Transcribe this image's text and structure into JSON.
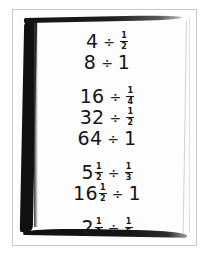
{
  "image": {
    "kind": "photograph",
    "subject": "handwritten-math-worksheet",
    "description": "A photographed sheet of white paper with a heavy black brush-drawn border, showing handwritten division expressions grouped into four blocks",
    "frame_color": "#c9c9c9",
    "border_color": "#111111",
    "paper_color": "#fdfdfd",
    "ink_color": "#151515"
  },
  "worksheet": {
    "groups": [
      {
        "id": "group-1",
        "lines": [
          {
            "id": "line-1",
            "text": "4 ÷ 1/2",
            "left": {
              "whole": "4"
            },
            "operator": "÷",
            "right": {
              "numerator": "1",
              "denominator": "2"
            }
          },
          {
            "id": "line-2",
            "text": "8 ÷ 1",
            "left": {
              "whole": "8"
            },
            "operator": "÷",
            "right": {
              "whole": "1"
            }
          }
        ]
      },
      {
        "id": "group-2",
        "lines": [
          {
            "id": "line-3",
            "text": "16 ÷ 1/4",
            "left": {
              "whole": "16"
            },
            "operator": "÷",
            "right": {
              "numerator": "1",
              "denominator": "4"
            }
          },
          {
            "id": "line-4",
            "text": "32 ÷ 1/2",
            "left": {
              "whole": "32"
            },
            "operator": "÷",
            "right": {
              "numerator": "1",
              "denominator": "2"
            }
          },
          {
            "id": "line-5",
            "text": "64 ÷ 1",
            "left": {
              "whole": "64"
            },
            "operator": "÷",
            "right": {
              "whole": "1"
            }
          }
        ]
      },
      {
        "id": "group-3",
        "lines": [
          {
            "id": "line-6",
            "text": "5 1/2 ÷ 1/3",
            "left": {
              "whole": "5",
              "numerator": "1",
              "denominator": "2"
            },
            "operator": "÷",
            "right": {
              "numerator": "1",
              "denominator": "3"
            }
          },
          {
            "id": "line-7",
            "text": "16 1/2 ÷ 1",
            "left": {
              "whole": "16",
              "numerator": "1",
              "denominator": "2"
            },
            "operator": "÷",
            "right": {
              "whole": "1"
            }
          }
        ]
      },
      {
        "id": "group-4",
        "lines": [
          {
            "id": "line-8",
            "text": "2 1/2 ÷ 1/5",
            "left": {
              "whole": "2",
              "numerator": "1",
              "denominator": "2"
            },
            "operator": "÷",
            "right": {
              "numerator": "1",
              "denominator": "5"
            }
          }
        ]
      }
    ]
  }
}
